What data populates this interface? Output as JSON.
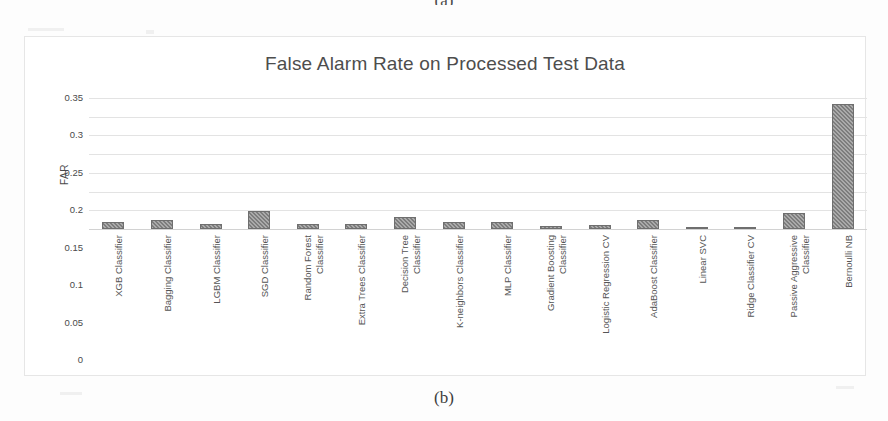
{
  "figure": {
    "caption_top": "(a)",
    "caption_bottom": "(b)"
  },
  "chart_data": {
    "type": "bar",
    "title": "False Alarm Rate on Processed Test Data",
    "xlabel": "",
    "ylabel": "FAR",
    "ylim": [
      0,
      0.35
    ],
    "ytick_labels": [
      "0.35",
      "0.3",
      "0.25",
      "0.2",
      "0.15",
      "0.1",
      "0.05",
      "0"
    ],
    "ytick_values": [
      0.35,
      0.3,
      0.25,
      0.2,
      0.15,
      0.1,
      0.05,
      0
    ],
    "grid": true,
    "legend": "none",
    "bar_color": "#7d7d7d",
    "categories": [
      "XGB Classifier",
      "Bagging Classifier",
      "LGBM Classifier",
      "SGD Classifier",
      "Random Forest Classifier",
      "Extra Trees Classifier",
      "Decision Tree Classifier",
      "K-neighbors Classifier",
      "MLP Classifier",
      "Gradient Boosting Classifier",
      "Logistic Regression CV",
      "AdaBoost Classifier",
      "Linear SVC",
      "Ridge Classifier CV",
      "Passive Aggressive Classifier",
      "Bernoulli NB"
    ],
    "category_lines": [
      [
        "XGB Classifier"
      ],
      [
        "Bagging Classifier"
      ],
      [
        "LGBM Classifier"
      ],
      [
        "SGD Classifier"
      ],
      [
        "Random Forest",
        "Classifier"
      ],
      [
        "Extra Trees Classifier"
      ],
      [
        "Decision Tree",
        "Classifier"
      ],
      [
        "K-neighbors Classifier"
      ],
      [
        "MLP Classifier"
      ],
      [
        "Gradient Boosting",
        "Classifier"
      ],
      [
        "Logistic Regression CV"
      ],
      [
        "AdaBoost Classifier"
      ],
      [
        "Linear SVC"
      ],
      [
        "Ridge Classifier CV"
      ],
      [
        "Passive Aggressive",
        "Classifier"
      ],
      [
        "Bernoulli NB"
      ]
    ],
    "values": [
      0.018,
      0.023,
      0.013,
      0.047,
      0.013,
      0.013,
      0.033,
      0.02,
      0.02,
      0.007,
      0.01,
      0.025,
      0.005,
      0.0,
      0.042,
      0.333
    ]
  }
}
